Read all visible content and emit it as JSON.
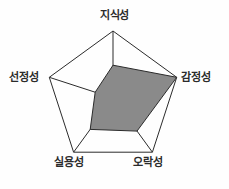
{
  "chart_data": {
    "type": "radar",
    "title": "",
    "categories": [
      "지식성",
      "감정성",
      "오락성",
      "실용성",
      "선정성"
    ],
    "values": [
      0.49,
      1.0,
      0.61,
      0.58,
      0.28
    ],
    "rlim": [
      0,
      1
    ],
    "grid": false,
    "legend": false,
    "fill_color": "#8a8a8a",
    "outline_color": "#2b2b2b",
    "spoke_color": "#2b2b2b",
    "series": [
      {
        "name": "",
        "values": [
          0.49,
          1.0,
          0.61,
          0.58,
          0.28
        ]
      }
    ]
  },
  "labels": {
    "top": "지식성",
    "right": "감정성",
    "bottom_right": "오락성",
    "bottom_left": "실용성",
    "left": "선정성"
  }
}
